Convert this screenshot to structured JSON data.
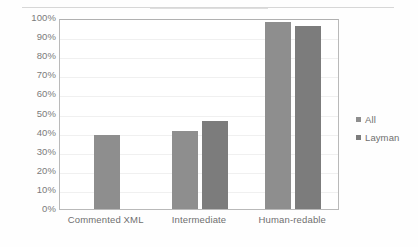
{
  "chart_data": {
    "type": "bar",
    "title": "",
    "subtitle": "",
    "xlabel": "",
    "ylabel": "",
    "ylim": [
      0,
      100
    ],
    "y_unit": "%",
    "grid": true,
    "legend_position": "right",
    "categories": [
      "Commented XML",
      "Intermediate",
      "Human-redable"
    ],
    "y_ticks": [
      "0%",
      "10%",
      "20%",
      "30%",
      "40%",
      "50%",
      "60%",
      "70%",
      "80%",
      "90%",
      "100%"
    ],
    "y_tick_values": [
      0,
      10,
      20,
      30,
      40,
      50,
      60,
      70,
      80,
      90,
      100
    ],
    "series": [
      {
        "name": "All",
        "color": "#8e8e8e",
        "values": [
          39,
          41,
          98
        ]
      },
      {
        "name": "Layman",
        "color": "#7c7c7c",
        "values": [
          null,
          46,
          96
        ]
      }
    ]
  },
  "legend": {
    "items": [
      {
        "label": "All"
      },
      {
        "label": "Layman"
      }
    ]
  }
}
